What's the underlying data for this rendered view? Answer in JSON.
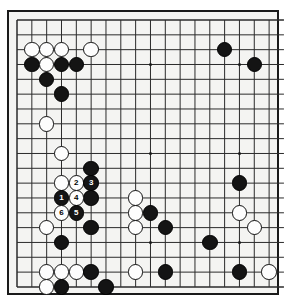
{
  "app": {
    "title": "Go Board Diagram",
    "board_size": 19,
    "visible_columns": 18,
    "visible_rows": 19,
    "colors": {
      "board": "#f4f4f2",
      "line": "#2b2b2b",
      "black_stone": "#141414",
      "white_stone": "#fdfdfd",
      "border": "#1a1a1a",
      "page_background": "#ffffff"
    }
  },
  "board": {
    "geometry": {
      "origin_x": 17,
      "origin_y": 20,
      "cell": 14.83,
      "stone_diameter": 15.5
    },
    "star_points": [
      {
        "col": 3,
        "row": 3
      },
      {
        "col": 9,
        "row": 3
      },
      {
        "col": 15,
        "row": 3
      },
      {
        "col": 3,
        "row": 9
      },
      {
        "col": 9,
        "row": 9
      },
      {
        "col": 15,
        "row": 9
      },
      {
        "col": 3,
        "row": 15
      },
      {
        "col": 9,
        "row": 15
      },
      {
        "col": 15,
        "row": 15
      }
    ],
    "stones": [
      {
        "col": 1,
        "row": 2,
        "color": "white",
        "label": ""
      },
      {
        "col": 2,
        "row": 2,
        "color": "white",
        "label": ""
      },
      {
        "col": 3,
        "row": 2,
        "color": "white",
        "label": ""
      },
      {
        "col": 5,
        "row": 2,
        "color": "white",
        "label": ""
      },
      {
        "col": 1,
        "row": 3,
        "color": "black",
        "label": ""
      },
      {
        "col": 2,
        "row": 3,
        "color": "white",
        "label": ""
      },
      {
        "col": 3,
        "row": 3,
        "color": "black",
        "label": ""
      },
      {
        "col": 4,
        "row": 3,
        "color": "black",
        "label": ""
      },
      {
        "col": 2,
        "row": 4,
        "color": "black",
        "label": ""
      },
      {
        "col": 3,
        "row": 5,
        "color": "black",
        "label": ""
      },
      {
        "col": 14,
        "row": 2,
        "color": "black",
        "label": ""
      },
      {
        "col": 16,
        "row": 3,
        "color": "black",
        "label": ""
      },
      {
        "col": 2,
        "row": 7,
        "color": "white",
        "label": ""
      },
      {
        "col": 3,
        "row": 9,
        "color": "white",
        "label": ""
      },
      {
        "col": 5,
        "row": 10,
        "color": "black",
        "label": ""
      },
      {
        "col": 3,
        "row": 11,
        "color": "white",
        "label": ""
      },
      {
        "col": 4,
        "row": 11,
        "color": "white",
        "label": "2"
      },
      {
        "col": 5,
        "row": 11,
        "color": "black",
        "label": "3"
      },
      {
        "col": 3,
        "row": 12,
        "color": "black",
        "label": "1"
      },
      {
        "col": 4,
        "row": 12,
        "color": "white",
        "label": "4"
      },
      {
        "col": 5,
        "row": 12,
        "color": "black",
        "label": ""
      },
      {
        "col": 3,
        "row": 13,
        "color": "white",
        "label": "6"
      },
      {
        "col": 4,
        "row": 13,
        "color": "black",
        "label": "5"
      },
      {
        "col": 5,
        "row": 14,
        "color": "black",
        "label": ""
      },
      {
        "col": 2,
        "row": 14,
        "color": "white",
        "label": ""
      },
      {
        "col": 3,
        "row": 15,
        "color": "black",
        "label": ""
      },
      {
        "col": 8,
        "row": 12,
        "color": "white",
        "label": ""
      },
      {
        "col": 8,
        "row": 13,
        "color": "white",
        "label": ""
      },
      {
        "col": 9,
        "row": 13,
        "color": "black",
        "label": ""
      },
      {
        "col": 8,
        "row": 14,
        "color": "white",
        "label": ""
      },
      {
        "col": 10,
        "row": 14,
        "color": "black",
        "label": ""
      },
      {
        "col": 15,
        "row": 11,
        "color": "black",
        "label": ""
      },
      {
        "col": 15,
        "row": 13,
        "color": "white",
        "label": ""
      },
      {
        "col": 16,
        "row": 14,
        "color": "white",
        "label": ""
      },
      {
        "col": 13,
        "row": 15,
        "color": "black",
        "label": ""
      },
      {
        "col": 2,
        "row": 17,
        "color": "white",
        "label": ""
      },
      {
        "col": 3,
        "row": 17,
        "color": "white",
        "label": ""
      },
      {
        "col": 4,
        "row": 17,
        "color": "white",
        "label": ""
      },
      {
        "col": 5,
        "row": 17,
        "color": "black",
        "label": ""
      },
      {
        "col": 8,
        "row": 17,
        "color": "white",
        "label": ""
      },
      {
        "col": 10,
        "row": 17,
        "color": "black",
        "label": ""
      },
      {
        "col": 15,
        "row": 17,
        "color": "black",
        "label": ""
      },
      {
        "col": 17,
        "row": 17,
        "color": "white",
        "label": ""
      },
      {
        "col": 2,
        "row": 18,
        "color": "white",
        "label": ""
      },
      {
        "col": 3,
        "row": 18,
        "color": "black",
        "label": ""
      },
      {
        "col": 6,
        "row": 18,
        "color": "black",
        "label": ""
      }
    ],
    "move_sequence": [
      {
        "number": "1",
        "color": "black"
      },
      {
        "number": "2",
        "color": "white"
      },
      {
        "number": "3",
        "color": "black"
      },
      {
        "number": "4",
        "color": "white"
      },
      {
        "number": "5",
        "color": "black"
      },
      {
        "number": "6",
        "color": "white"
      }
    ]
  }
}
